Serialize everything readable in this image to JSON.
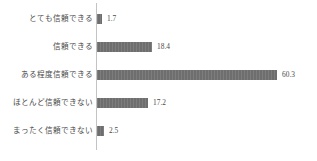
{
  "chart_data": {
    "type": "bar",
    "orientation": "horizontal",
    "title": "",
    "xlabel": "",
    "ylabel": "",
    "grid": false,
    "legend": false,
    "axis_line": "vertical-category-axis",
    "xlim": [
      0,
      60.3
    ],
    "categories": [
      "とても信頼できる",
      "信頼できる",
      "ある程度信頼できる",
      "ほとんど信頼できない",
      "まったく信頼できない"
    ],
    "values": [
      1.7,
      18.4,
      60.3,
      17.2,
      2.5
    ],
    "value_labels": [
      "1.7",
      "18.4",
      "60.3",
      "17.2",
      "2.5"
    ],
    "bar_color": "#6e6e6e",
    "text_color": "#4a4a4a",
    "axis_color": "#c3c3c3",
    "background_color": "#ffffff"
  }
}
